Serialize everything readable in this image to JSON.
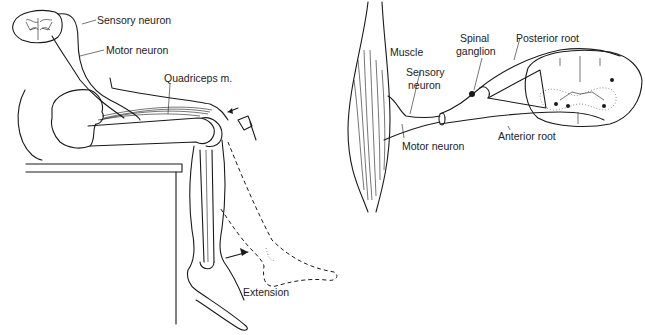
{
  "figure": {
    "left_panel": {
      "labels": {
        "sensory_neuron": "Sensory  neuron",
        "motor_neuron": "Motor neuron",
        "quadriceps": "Quadriceps m.",
        "extension": "Extension"
      }
    },
    "right_panel": {
      "labels": {
        "muscle": "Muscle",
        "sensory_neuron_1": "Sensory",
        "sensory_neuron_2": "neuron",
        "motor_neuron": "Motor neuron",
        "spinal_ganglion_1": "Spinal",
        "spinal_ganglion_2": "ganglion",
        "posterior_root": "Posterior root",
        "anterior_root": "Anterior root"
      }
    },
    "colors": {
      "ink": "#1a1a1a",
      "background": "#ffffff"
    }
  }
}
